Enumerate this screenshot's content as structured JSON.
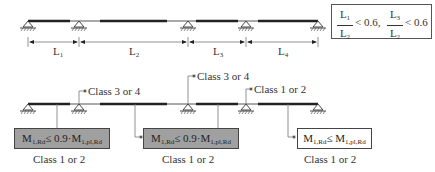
{
  "top_diagram": {
    "spans": [
      {
        "label": "L",
        "sub": "1"
      },
      {
        "label": "L",
        "sub": "2"
      },
      {
        "label": "L",
        "sub": "3"
      },
      {
        "label": "L",
        "sub": "4"
      }
    ],
    "condition": {
      "frac1": {
        "num": "L",
        "num_sub": "1",
        "den": "L",
        "den_sub": "2"
      },
      "cmp1": "< 0.6,",
      "frac2": {
        "num": "L",
        "num_sub": "3",
        "den": "L",
        "den_sub": "2"
      },
      "cmp2": "< 0.6"
    }
  },
  "bottom_diagram": {
    "support_labels": [
      {
        "text": "Class 3 or 4"
      },
      {
        "text": "Class 3 or 4"
      },
      {
        "text": "Class 1 or 2"
      }
    ],
    "span_boxes": [
      {
        "m": "M",
        "m_sub": "1,Rd",
        "op": "≤ 0.9·",
        "r": "M",
        "r_sub": "1,pl,Rd",
        "class": "Class 1 or 2",
        "fill": "#a0a0a0"
      },
      {
        "m": "M",
        "m_sub": "1,Rd",
        "op": "≤ 0.9·",
        "r": "M",
        "r_sub": "1,pl,Rd",
        "class": "Class 1 or 2",
        "fill": "#a0a0a0"
      },
      {
        "m": "M",
        "m_sub": "1,Rd",
        "op": "≤ ",
        "r": "M",
        "r_sub": "1,pl,Rd",
        "class": "Class 1 or 2",
        "fill": "#ffffff"
      }
    ]
  }
}
